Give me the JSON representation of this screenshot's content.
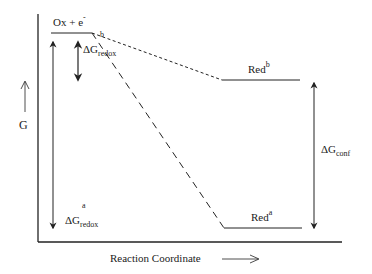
{
  "diagram": {
    "type": "energy-diagram",
    "y_axis_label": "G",
    "x_axis_label": "Reaction Coordinate",
    "states": {
      "initial": {
        "label": "Ox + e",
        "superscript": "-"
      },
      "red_b": {
        "label": "Red",
        "superscript": "b"
      },
      "red_a": {
        "label": "Red",
        "superscript": "a"
      }
    },
    "energies": {
      "dg_redox_b": {
        "symbol": "ΔG",
        "superscript": "b",
        "subscript": "redox"
      },
      "dg_redox_a": {
        "symbol": "ΔG",
        "superscript": "a",
        "subscript": "redox"
      },
      "dg_conf": {
        "symbol": "ΔG",
        "subscript": "conf"
      }
    },
    "colors": {
      "ink": "#222222",
      "background": "#ffffff"
    }
  }
}
